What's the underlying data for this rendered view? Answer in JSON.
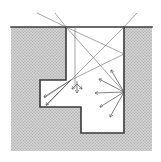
{
  "diagram": {
    "type": "cavity-light-scattering",
    "canvas": {
      "width": 161,
      "height": 162,
      "background": "#ffffff"
    },
    "colors": {
      "ground_fill": "#c9c9c9",
      "ground_dot": "#9a9a9a",
      "cavity_fill": "#ffffff",
      "wall": "#3a3a3a",
      "ray": "#6a6a6a",
      "arrow": "#4a4a4a"
    },
    "ground": {
      "x": 11,
      "y": 27,
      "width": 141,
      "height": 124
    },
    "surface_line": {
      "x1": 11,
      "y1": 27,
      "x2": 152,
      "y2": 27
    },
    "cavity_outline": [
      [
        66,
        27
      ],
      [
        66,
        80
      ],
      [
        40,
        80
      ],
      [
        40,
        107
      ],
      [
        81,
        107
      ],
      [
        81,
        133
      ],
      [
        124,
        133
      ],
      [
        124,
        27
      ]
    ],
    "incident_rays": [
      {
        "from": [
          37,
          13
        ],
        "to": [
          66,
          27
        ]
      },
      {
        "from": [
          55,
          13
        ],
        "to": [
          66,
          27
        ]
      },
      {
        "from": [
          137,
          13
        ],
        "to": [
          124,
          27
        ]
      },
      {
        "from": [
          66,
          27
        ],
        "to": [
          124,
          54
        ]
      },
      {
        "from": [
          66,
          27
        ],
        "to": [
          124,
          92
        ]
      },
      {
        "from": [
          124,
          27
        ],
        "to": [
          71,
          80
        ]
      },
      {
        "from": [
          75,
          27
        ],
        "to": [
          75,
          88
        ]
      },
      {
        "from": [
          124,
          54
        ],
        "to": [
          71,
          80
        ]
      },
      {
        "from": [
          71,
          80
        ],
        "to": [
          44,
          98
        ]
      },
      {
        "from": [
          71,
          80
        ],
        "to": [
          46,
          106
        ]
      }
    ],
    "scatter_arrows": [
      {
        "from": [
          124,
          92
        ],
        "to": [
          111,
          70
        ]
      },
      {
        "from": [
          124,
          92
        ],
        "to": [
          99,
          79
        ]
      },
      {
        "from": [
          124,
          92
        ],
        "to": [
          95,
          93
        ]
      },
      {
        "from": [
          124,
          92
        ],
        "to": [
          100,
          107
        ]
      },
      {
        "from": [
          124,
          92
        ],
        "to": [
          110,
          117
        ]
      },
      {
        "from": [
          71,
          80
        ],
        "to": [
          44,
          97
        ]
      },
      {
        "from": [
          71,
          80
        ],
        "to": [
          46,
          105
        ]
      },
      {
        "from": [
          77,
          81
        ],
        "to": [
          77,
          93
        ]
      },
      {
        "from": [
          77,
          84
        ],
        "to": [
          72,
          89
        ]
      },
      {
        "from": [
          77,
          84
        ],
        "to": [
          82,
          89
        ]
      }
    ]
  }
}
